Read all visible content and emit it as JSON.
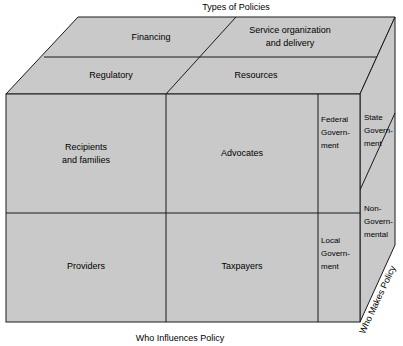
{
  "diagram": {
    "title_top": "Types of Policies",
    "title_bottom": "Who Influences Policy",
    "title_right": "Who Makes Policy",
    "fill_color": "#c9c9c9",
    "line_color": "#1a1a1a",
    "top_face": {
      "back_row": [
        {
          "label": "Financing"
        },
        {
          "label_line1": "Service organization",
          "label_line2": "and delivery"
        }
      ],
      "front_row": [
        {
          "label": "Regulatory"
        },
        {
          "label": "Resources"
        }
      ]
    },
    "front_face": {
      "quadrants": [
        {
          "label_line1": "Recipients",
          "label_line2": "and families"
        },
        {
          "label_line1": "Advocates",
          "label_line2": ""
        },
        {
          "label_line1": "Providers",
          "label_line2": ""
        },
        {
          "label_line1": "Taxpayers",
          "label_line2": ""
        }
      ],
      "side_columns": [
        {
          "line1": "Federal",
          "line2": "Govern-",
          "line3": "ment"
        },
        {
          "line1": "Local",
          "line2": "Govern-",
          "line3": "ment"
        }
      ]
    },
    "right_face": {
      "panels": [
        {
          "line1": "State",
          "line2": "Govern-",
          "line3": "ment"
        },
        {
          "line1": "Non-",
          "line2": "Govern-",
          "line3": "mental"
        }
      ]
    }
  }
}
